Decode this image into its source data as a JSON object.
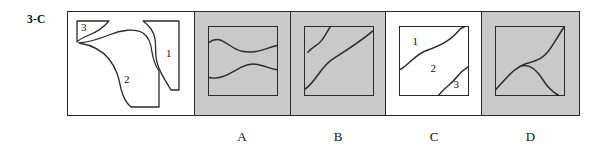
{
  "item": {
    "label": "3-C",
    "type": "spatial-reasoning-multiple-choice"
  },
  "problem": {
    "name": "torn-paper-pieces",
    "background": "#ffffff",
    "piece_labels": [
      "1",
      "2",
      "3"
    ],
    "description": "Square outline containing three irregular torn paper fragments numbered 1, 2 and 3"
  },
  "options": [
    {
      "letter": "A",
      "shaded": true,
      "background": "#c9c9c9",
      "figure": "two-horizontal-s-curves",
      "piece_labels": []
    },
    {
      "letter": "B",
      "shaded": true,
      "background": "#c9c9c9",
      "figure": "diagonal-s-curve-with-small-hook",
      "piece_labels": []
    },
    {
      "letter": "C",
      "shaded": false,
      "background": "#ffffff",
      "figure": "diagonal-s-curve-with-corner-arc",
      "piece_labels": [
        "1",
        "2",
        "3"
      ]
    },
    {
      "letter": "D",
      "shaded": true,
      "background": "#c9c9c9",
      "figure": "two-curves-meeting-at-center-point",
      "piece_labels": []
    }
  ],
  "colors": {
    "ink": "#2b2b2b",
    "shade": "#c9c9c9",
    "paper": "#ffffff",
    "text": "#111111"
  }
}
